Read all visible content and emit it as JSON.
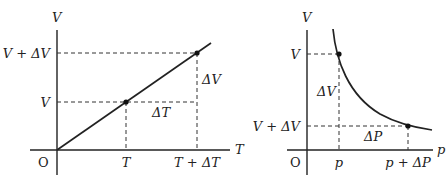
{
  "left_diagram": {
    "title": "V-T graph (constant pressure)",
    "y_axis_label": "V",
    "x_axis_label": "T",
    "origin_label": "O",
    "y_ticks": [
      "V + ΔV",
      "V"
    ],
    "x_ticks": [
      "T",
      "T + ΔT"
    ],
    "delta_labels": {
      "dV": "ΔV",
      "dT": "ΔT"
    },
    "points": [
      {
        "x_label": "T",
        "y_label": "V"
      },
      {
        "x_label": "T + ΔT",
        "y_label": "V + ΔV"
      }
    ]
  },
  "right_diagram": {
    "title": "V-p graph (constant temperature)",
    "y_axis_label": "V",
    "x_axis_label": "p",
    "origin_label": "O",
    "y_ticks": [
      "V",
      "V + ΔV"
    ],
    "x_ticks": [
      "p",
      "p + ΔP"
    ],
    "delta_labels": {
      "dV": "ΔV",
      "dP": "ΔP"
    },
    "points": [
      {
        "x_label": "p",
        "y_label": "V"
      },
      {
        "x_label": "p + ΔP",
        "y_label": "V + ΔV"
      }
    ]
  }
}
